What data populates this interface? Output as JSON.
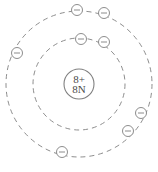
{
  "diagram": {
    "type": "bohr-atom-model",
    "background_color": "#ffffff",
    "stroke_color": "#808080",
    "text_color": "#4a4a4a",
    "canvas": {
      "width": 158,
      "height": 172
    },
    "nucleus": {
      "label_top": "8+",
      "label_bottom": "8N",
      "center_x": 79,
      "center_y": 84,
      "radius": 15,
      "font_size": 11
    },
    "shells": [
      {
        "name": "inner-shell",
        "index": 1,
        "radius": 46,
        "electron_count": 2,
        "dash_pattern": "5,4"
      },
      {
        "name": "outer-shell",
        "index": 2,
        "radius": 73,
        "electron_count": 6,
        "dash_pattern": "5,4"
      }
    ],
    "electrons": [
      {
        "id": "e1",
        "shell": "inner-shell",
        "cx": 81,
        "cy": 39,
        "r": 5.5,
        "charge": "-"
      },
      {
        "id": "e2",
        "shell": "inner-shell",
        "cx": 104,
        "cy": 42,
        "r": 5.5,
        "charge": "-"
      },
      {
        "id": "e3",
        "shell": "outer-shell",
        "cx": 77,
        "cy": 10,
        "r": 5.5,
        "charge": "-"
      },
      {
        "id": "e4",
        "shell": "outer-shell",
        "cx": 104,
        "cy": 13,
        "r": 5.5,
        "charge": "-"
      },
      {
        "id": "e5",
        "shell": "outer-shell",
        "cx": 17,
        "cy": 53,
        "r": 5.5,
        "charge": "-"
      },
      {
        "id": "e6",
        "shell": "outer-shell",
        "cx": 141,
        "cy": 113,
        "r": 5.5,
        "charge": "-"
      },
      {
        "id": "e7",
        "shell": "outer-shell",
        "cx": 128,
        "cy": 131,
        "r": 5.5,
        "charge": "-"
      },
      {
        "id": "e8",
        "shell": "outer-shell",
        "cx": 62,
        "cy": 152,
        "r": 5.5,
        "charge": "-"
      }
    ]
  }
}
